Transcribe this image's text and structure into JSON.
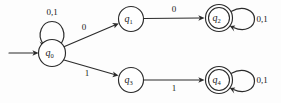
{
  "figure": {
    "kind": "finite-state-automaton-diagram",
    "colors": {
      "stroke": "#2b2b2b",
      "text": "#1a1a1a",
      "background": "#fdfdfd"
    }
  },
  "states": [
    {
      "id": "q0",
      "base": "q",
      "subscript": "0",
      "accepting": false,
      "start": true,
      "cx": 52,
      "cy": 53,
      "r": 13.5
    },
    {
      "id": "q1",
      "base": "q",
      "subscript": "1",
      "accepting": false,
      "start": false,
      "cx": 131,
      "cy": 19,
      "r": 12.5
    },
    {
      "id": "q2",
      "base": "q",
      "subscript": "2",
      "accepting": true,
      "start": false,
      "cx": 219,
      "cy": 18,
      "r": 13.5
    },
    {
      "id": "q3",
      "base": "q",
      "subscript": "3",
      "accepting": false,
      "start": false,
      "cx": 131,
      "cy": 80,
      "r": 12.5
    },
    {
      "id": "q4",
      "base": "q",
      "subscript": "4",
      "accepting": true,
      "start": false,
      "cx": 219,
      "cy": 80,
      "r": 13.5
    }
  ],
  "transitions": [
    {
      "name": "start-arrow",
      "from": null,
      "to": "q0",
      "label": "",
      "label_x": 0,
      "label_y": 0
    },
    {
      "name": "q0-self-loop",
      "from": "q0",
      "to": "q0",
      "label": "0,1",
      "label_x": 52,
      "label_y": 13
    },
    {
      "name": "q0-to-q1",
      "from": "q0",
      "to": "q1",
      "label": "0",
      "label_x": 84,
      "label_y": 28
    },
    {
      "name": "q0-to-q3",
      "from": "q0",
      "to": "q3",
      "label": "1",
      "label_x": 87,
      "label_y": 74
    },
    {
      "name": "q1-to-q2",
      "from": "q1",
      "to": "q2",
      "label": "0",
      "label_x": 174,
      "label_y": 10
    },
    {
      "name": "q3-to-q4",
      "from": "q3",
      "to": "q4",
      "label": "1",
      "label_x": 174,
      "label_y": 89
    },
    {
      "name": "q2-self-loop",
      "from": "q2",
      "to": "q2",
      "label": "0,1",
      "label_x": 262,
      "label_y": 20
    },
    {
      "name": "q4-self-loop",
      "from": "q4",
      "to": "q4",
      "label": "0,1",
      "label_x": 262,
      "label_y": 81
    }
  ]
}
